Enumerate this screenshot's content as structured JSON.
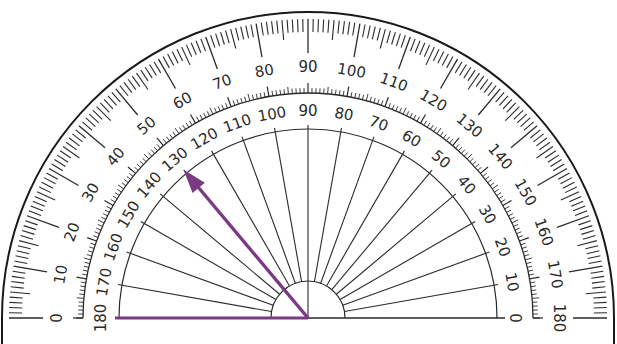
{
  "diagram": {
    "center": {
      "x": 308,
      "y": 318
    },
    "radii": {
      "outer_edge": 306,
      "outer_tick_start": 299,
      "outer_tick_short_end": 286,
      "outer_tick_mid_end": 279,
      "outer_tick_long_end": 265,
      "outer_label": 251,
      "inner_scale_arc": 225,
      "inner_tick_short_end": 230,
      "inner_tick_mid_end": 232,
      "inner_tick_long_end": 235,
      "inner_label": 207,
      "inner_line_arc": 189,
      "spoke_end": 193,
      "hub": 37
    },
    "outer_scale": {
      "name": "outer scale (counter-clockwise from left)",
      "labels": [
        "0",
        "10",
        "20",
        "30",
        "40",
        "50",
        "60",
        "70",
        "80",
        "90",
        "100",
        "110",
        "120",
        "130",
        "140",
        "150",
        "160",
        "170",
        "180"
      ]
    },
    "inner_scale": {
      "name": "inner scale (clockwise from right)",
      "labels": [
        "180",
        "170",
        "160",
        "150",
        "140",
        "130",
        "120",
        "110",
        "100",
        "90",
        "80",
        "70",
        "60",
        "50",
        "40",
        "30",
        "20",
        "10",
        "0"
      ]
    },
    "angle": {
      "measured_degrees": 130,
      "scale_read": "inner",
      "base_ray": {
        "from": "center",
        "direction_deg": 180
      },
      "arrow_ray": {
        "from": "center",
        "direction_deg": 130
      }
    },
    "colors": {
      "ink": "#2a2a2a",
      "edge": "#1a1a1a",
      "angle_rays": "#7b3b84",
      "background": "#ffffff"
    }
  }
}
